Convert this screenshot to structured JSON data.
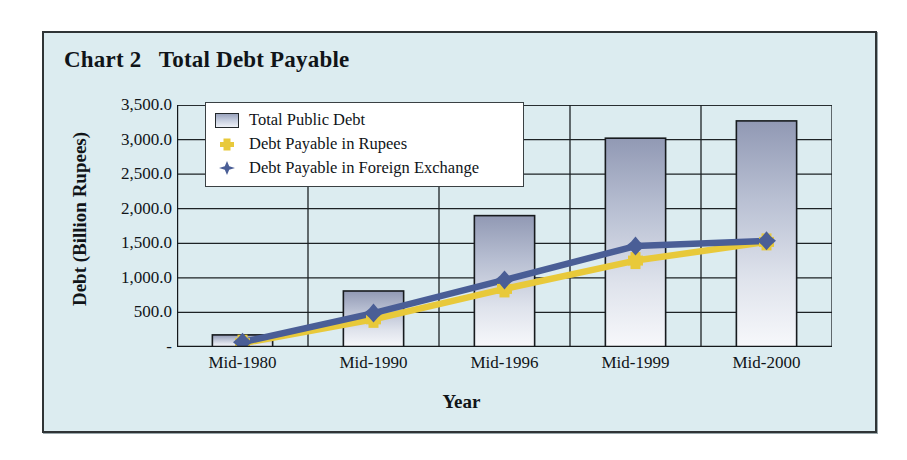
{
  "panel": {
    "title": "Chart 2   Total Debt Payable",
    "background_color": "#dcecf0",
    "border_color": "#2f3436"
  },
  "legend": {
    "position": "top-left-inside-plot",
    "entries": [
      {
        "label": "Total Public Debt",
        "marker": "bar-swatch",
        "color": "#aab2c8"
      },
      {
        "label": "Debt Payable in Rupees",
        "marker": "square",
        "color": "#e8c93a"
      },
      {
        "label": "Debt Payable in Foreign Exchange",
        "marker": "diamond",
        "color": "#4a5e96"
      }
    ]
  },
  "chart_data": {
    "type": "bar",
    "title": "Chart 2   Total Debt Payable",
    "xlabel": "Year",
    "ylabel": "Debt (Billion Rupees)",
    "categories": [
      "Mid-1980",
      "Mid-1990",
      "Mid-1996",
      "Mid-1999",
      "Mid-2000"
    ],
    "ylim": [
      0,
      3500
    ],
    "ytick_values": [
      0,
      500,
      1000,
      1500,
      2000,
      2500,
      3000,
      3500
    ],
    "ytick_labels": [
      "-",
      "500.0",
      "1,000.0",
      "1,500.0",
      "2,000.0",
      "2,500.0",
      "3,000.0",
      "3,500.0"
    ],
    "grid": true,
    "legend_position": "upper left",
    "series": [
      {
        "name": "Total Public Debt",
        "type": "bar",
        "color": "#aab2c8",
        "values": [
          175,
          810,
          1900,
          3020,
          3270
        ]
      },
      {
        "name": "Debt Payable in Rupees",
        "type": "line",
        "color": "#e8c93a",
        "marker": "square",
        "values": [
          55,
          400,
          840,
          1250,
          1520
        ]
      },
      {
        "name": "Debt Payable in Foreign Exchange",
        "type": "line",
        "color": "#4a5e96",
        "marker": "diamond",
        "values": [
          70,
          490,
          970,
          1460,
          1535
        ]
      }
    ]
  }
}
